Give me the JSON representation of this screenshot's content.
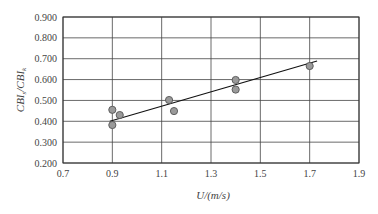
{
  "chart_data": {
    "type": "scatter",
    "title": "",
    "xlabel": "U/(m/s)",
    "ylabel": "CBI_s/CBI_k",
    "ylabel_parts": {
      "main1": "CBI",
      "sub1": "s",
      "slash": "/",
      "main2": "CBI",
      "sub2": "k"
    },
    "xlim": [
      0.7,
      1.9
    ],
    "ylim": [
      0.2,
      0.9
    ],
    "grid": true,
    "x_ticks": [
      "0.7",
      "0.9",
      "1.1",
      "1.3",
      "1.5",
      "1.7",
      "1.9"
    ],
    "y_ticks": [
      "0.200",
      "0.300",
      "0.400",
      "0.500",
      "0.600",
      "0.700",
      "0.800",
      "0.900"
    ],
    "series": [
      {
        "name": "measured",
        "marker": "circle",
        "color": "#9a9a9a",
        "points": [
          {
            "x": 0.9,
            "y": 0.455
          },
          {
            "x": 0.9,
            "y": 0.382
          },
          {
            "x": 0.93,
            "y": 0.43
          },
          {
            "x": 1.13,
            "y": 0.502
          },
          {
            "x": 1.15,
            "y": 0.449
          },
          {
            "x": 1.4,
            "y": 0.598
          },
          {
            "x": 1.4,
            "y": 0.552
          },
          {
            "x": 1.7,
            "y": 0.665
          }
        ]
      },
      {
        "name": "linear fit",
        "type": "line",
        "color": "#111111",
        "points": [
          {
            "x": 0.89,
            "y": 0.4
          },
          {
            "x": 1.73,
            "y": 0.689
          }
        ]
      }
    ],
    "legend": null
  }
}
